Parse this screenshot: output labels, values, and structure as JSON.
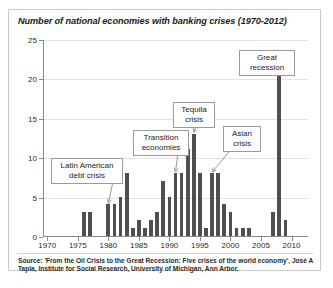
{
  "figure": {
    "title": "Number of national economies with banking crises (1970-2012)",
    "source": "Source: 'From the Oil Crisis to the Great Recession: Five crises of the world economy', José A Tapia, Institute for Social Research, University of Michigan, Ann Arbor.",
    "bar_color": "#4f4f4f",
    "axis_color": "#8a8a8a",
    "grid_color": "#e2e2e2"
  },
  "chart_data": {
    "type": "bar",
    "title": "Number of national economies with banking crises (1970-2012)",
    "xlabel": "",
    "ylabel": "",
    "ylim": [
      0,
      25
    ],
    "yticks": [
      0,
      5,
      10,
      15,
      20,
      25
    ],
    "ytick_labels": [
      "0",
      "5",
      "10",
      "15",
      "20",
      "25"
    ],
    "xlim": [
      1969.3,
      2012.7
    ],
    "xticks": [
      1970,
      1975,
      1980,
      1985,
      1990,
      1995,
      2000,
      2005,
      2010
    ],
    "xtick_labels": [
      "1970",
      "1975",
      "1980",
      "1985",
      "1990",
      "1995",
      "2000",
      "2005",
      "2010"
    ],
    "grid": "horizontal",
    "legend": "none",
    "categories": [
      1970,
      1971,
      1972,
      1973,
      1974,
      1975,
      1976,
      1977,
      1978,
      1979,
      1980,
      1981,
      1982,
      1983,
      1984,
      1985,
      1986,
      1987,
      1988,
      1989,
      1990,
      1991,
      1992,
      1993,
      1994,
      1995,
      1996,
      1997,
      1998,
      1999,
      2000,
      2001,
      2002,
      2003,
      2004,
      2005,
      2006,
      2007,
      2008,
      2009,
      2010,
      2011,
      2012
    ],
    "values": [
      0,
      0,
      0,
      0,
      0,
      0,
      3,
      3,
      0,
      0,
      4,
      4,
      5,
      8,
      1,
      2,
      1,
      2,
      3,
      7,
      5,
      8,
      8,
      11,
      13,
      8,
      1,
      8,
      8,
      4,
      3,
      1,
      1,
      1,
      0,
      0,
      0,
      3,
      22,
      2,
      0,
      0,
      0
    ],
    "annotations": [
      {
        "label": "Latin American\ndebt crisis",
        "points_to_year": 1980,
        "points_to_value": 4
      },
      {
        "label": "Transition\neconomies",
        "points_to_year": 1991,
        "points_to_value": 8
      },
      {
        "label": "Tequila\ncrisis",
        "points_to_year": 1994,
        "points_to_value": 13
      },
      {
        "label": "Asian\ncrisis",
        "points_to_year": 1997,
        "points_to_value": 8
      },
      {
        "label": "Great\nrecession",
        "points_to_year": 2008,
        "points_to_value": 22
      }
    ]
  }
}
